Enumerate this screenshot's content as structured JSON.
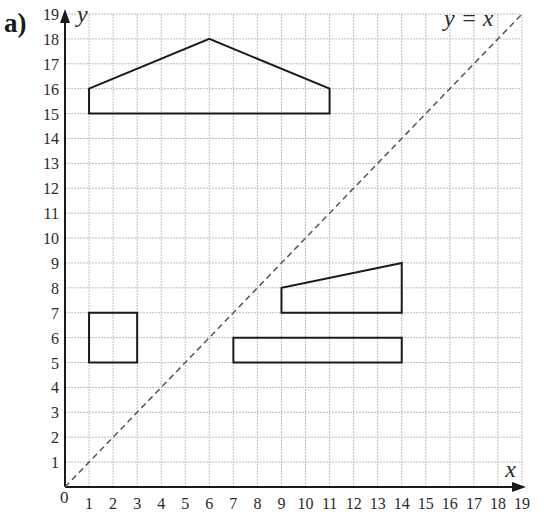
{
  "part_label": "a)",
  "axes": {
    "x_label": "x",
    "y_label": "y",
    "origin_label": "0",
    "x_ticks": [
      "1",
      "2",
      "3",
      "4",
      "5",
      "6",
      "7",
      "8",
      "9",
      "10",
      "11",
      "12",
      "13",
      "14",
      "15",
      "16",
      "17",
      "18",
      "19"
    ],
    "y_ticks": [
      "1",
      "2",
      "3",
      "4",
      "5",
      "6",
      "7",
      "8",
      "9",
      "10",
      "11",
      "12",
      "13",
      "14",
      "15",
      "16",
      "17",
      "18",
      "19"
    ],
    "xlim": [
      0,
      19
    ],
    "ylim": [
      0,
      19
    ],
    "grid": true
  },
  "line": {
    "label": "y = x",
    "style": "dashed"
  },
  "shapes": [
    {
      "name": "pentagon-house",
      "points": [
        [
          1,
          15
        ],
        [
          1,
          16
        ],
        [
          6,
          18
        ],
        [
          11,
          16
        ],
        [
          11,
          15
        ]
      ]
    },
    {
      "name": "trapezium",
      "points": [
        [
          9,
          7
        ],
        [
          9,
          8
        ],
        [
          14,
          9
        ],
        [
          14,
          7
        ]
      ]
    },
    {
      "name": "long-rectangle",
      "points": [
        [
          7,
          5
        ],
        [
          7,
          6
        ],
        [
          14,
          6
        ],
        [
          14,
          5
        ]
      ]
    },
    {
      "name": "square",
      "points": [
        [
          1,
          5
        ],
        [
          1,
          7
        ],
        [
          3,
          7
        ],
        [
          3,
          5
        ]
      ]
    }
  ],
  "colors": {
    "grid": "#bdbdbd",
    "axis": "#1a1a1a",
    "shape": "#1a1a1a",
    "line": "#555555"
  }
}
